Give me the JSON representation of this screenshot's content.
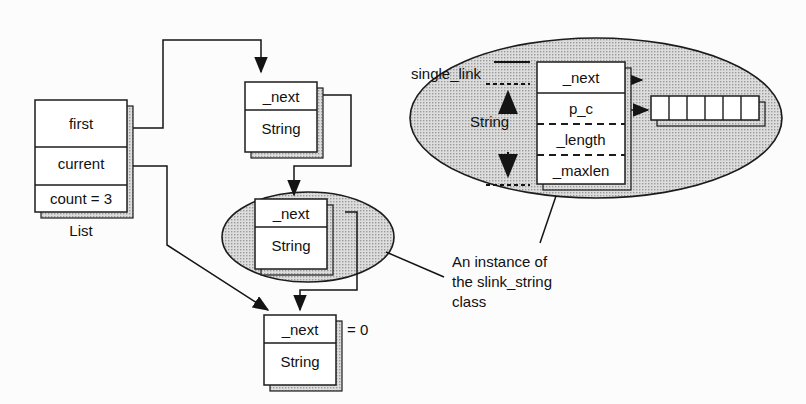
{
  "diagram": {
    "colors": {
      "ink": "#1a1a1a",
      "ellipse_fill": "#d2d2d2",
      "box_fill": "#ffffff",
      "shadow": "#8c8c8c",
      "background": "#fcfcfc"
    }
  },
  "list_object": {
    "name": "list-object",
    "caption": "List",
    "fields": [
      {
        "label": "first"
      },
      {
        "label": "current"
      },
      {
        "label": "count = 3"
      }
    ]
  },
  "nodes": [
    {
      "id": "node-1",
      "in_ellipse": false,
      "rows": [
        {
          "label": "_next"
        },
        {
          "label": "String"
        }
      ],
      "annotation": ""
    },
    {
      "id": "node-2",
      "in_ellipse": true,
      "rows": [
        {
          "label": "_next"
        },
        {
          "label": "String"
        }
      ],
      "annotation": ""
    },
    {
      "id": "node-3",
      "in_ellipse": false,
      "rows": [
        {
          "label": "_next"
        },
        {
          "label": "String"
        }
      ],
      "annotation": "= 0"
    }
  ],
  "detail": {
    "name": "slink-string-detail",
    "base_label": "single_link",
    "derived_label": "String",
    "fields": [
      {
        "label": "_next",
        "separator": "solid"
      },
      {
        "label": "p_c",
        "separator": "dashed"
      },
      {
        "label": "_length",
        "separator": "dashed"
      },
      {
        "label": "_maxlen",
        "separator": "none"
      }
    ],
    "char_array": {
      "cells": 6
    },
    "caption_lines": [
      "An instance of",
      "the slink_string",
      "class"
    ]
  }
}
